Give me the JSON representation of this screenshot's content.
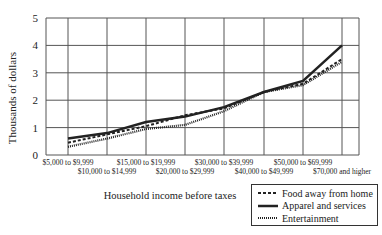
{
  "chart_data": {
    "type": "line",
    "title": "",
    "xlabel": "Household income before taxes",
    "ylabel": "Thousands of dollars",
    "ylim": [
      0,
      5
    ],
    "yticks": [
      0,
      1,
      2,
      3,
      4,
      5
    ],
    "grid": true,
    "legend_position": "bottom-right",
    "categories": [
      "$5,000 to $9,999",
      "$10,000 to $14,999",
      "$15,000 to $19,999",
      "$20,000 to $29,999",
      "$30,000 to $39,999",
      "$40,000 to $49,999",
      "$50,000 to $69,999",
      "$70,000 and higher"
    ],
    "series": [
      {
        "name": "Food away from home",
        "style": "dashed",
        "values": [
          0.45,
          0.75,
          1.05,
          1.45,
          1.7,
          2.3,
          2.6,
          3.5
        ]
      },
      {
        "name": "Apparel and services",
        "style": "solid",
        "values": [
          0.6,
          0.8,
          1.2,
          1.4,
          1.75,
          2.3,
          2.7,
          4.0
        ]
      },
      {
        "name": "Entertainment",
        "style": "dotted",
        "values": [
          0.3,
          0.6,
          0.95,
          1.1,
          1.6,
          2.3,
          2.55,
          3.4
        ]
      }
    ]
  }
}
